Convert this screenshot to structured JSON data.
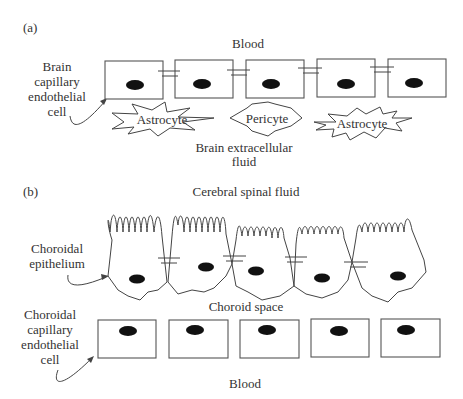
{
  "panel_a": {
    "label": "(a)",
    "top_label": "Blood",
    "side_label_lines": [
      "Brain",
      "capillary",
      "endothelial",
      "cell"
    ],
    "cells": [
      "Astrocyte",
      "Pericyte",
      "Astrocyte"
    ],
    "bottom_label_lines": [
      "Brain extracellular",
      "fluid"
    ]
  },
  "panel_b": {
    "label": "(b)",
    "top_label": "Cerebral spinal fluid",
    "epithelium_label_lines": [
      "Choroidal",
      "epithelium"
    ],
    "middle_label": "Choroid space",
    "endothelial_label_lines": [
      "Choroidal",
      "capillary",
      "endothelial",
      "cell"
    ],
    "bottom_label": "Blood"
  },
  "colors": {
    "line": "#444444",
    "nucleus": "#111111",
    "text": "#333333",
    "background": "#ffffff"
  }
}
